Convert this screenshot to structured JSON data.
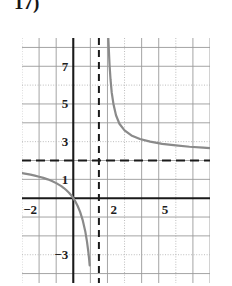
{
  "problem": {
    "number": "17)"
  },
  "chart_data": {
    "type": "line",
    "title": "",
    "xlabel": "",
    "ylabel": "",
    "xlim": [
      -3,
      8
    ],
    "ylim": [
      -4.5,
      8.5
    ],
    "grid": true,
    "grid_step": 1,
    "legend": false,
    "x_tick_labels": [
      {
        "value": -2,
        "text": "−2"
      },
      {
        "value": 2,
        "text": "2"
      },
      {
        "value": 5,
        "text": "5"
      }
    ],
    "y_tick_labels": [
      {
        "value": 7,
        "text": "7"
      },
      {
        "value": 5,
        "text": "5"
      },
      {
        "value": 3,
        "text": "3"
      },
      {
        "value": 1,
        "text": "1"
      },
      {
        "value": -3,
        "text": "−3"
      }
    ],
    "asymptotes": [
      {
        "name": "vertical-asymptote",
        "orientation": "vertical",
        "value": 1.5,
        "style": "dashed",
        "color": "#1a1a1a"
      },
      {
        "name": "horizontal-asymptote",
        "orientation": "horizontal",
        "value": 2.0,
        "style": "dashed",
        "color": "#1a1a1a"
      }
    ],
    "series": [
      {
        "name": "left-branch",
        "color": "#8a8a8a",
        "points": [
          [
            -3.0,
            1.33
          ],
          [
            -2.75,
            1.29
          ],
          [
            -2.5,
            1.25
          ],
          [
            -2.25,
            1.2
          ],
          [
            -2.0,
            1.14
          ],
          [
            -1.75,
            1.08
          ],
          [
            -1.5,
            1.0
          ],
          [
            -1.25,
            0.91
          ],
          [
            -1.0,
            0.8
          ],
          [
            -0.85,
            0.72
          ],
          [
            -0.7,
            0.64
          ],
          [
            -0.55,
            0.54
          ],
          [
            -0.4,
            0.42
          ],
          [
            -0.25,
            0.29
          ],
          [
            -0.1,
            0.13
          ],
          [
            0.0,
            0.0
          ],
          [
            0.1,
            -0.14
          ],
          [
            0.25,
            -0.4
          ],
          [
            0.4,
            -0.73
          ],
          [
            0.55,
            -1.16
          ],
          [
            0.7,
            -1.75
          ],
          [
            0.8,
            -2.29
          ],
          [
            0.88,
            -2.84
          ],
          [
            0.93,
            -3.26
          ],
          [
            0.96,
            -3.56
          ]
        ]
      },
      {
        "name": "right-branch",
        "color": "#8a8a8a",
        "points": [
          [
            2.05,
            8.5
          ],
          [
            2.08,
            7.9
          ],
          [
            2.12,
            7.1
          ],
          [
            2.18,
            6.3
          ],
          [
            2.25,
            5.6
          ],
          [
            2.35,
            5.0
          ],
          [
            2.5,
            4.4
          ],
          [
            2.7,
            3.95
          ],
          [
            3.0,
            3.6
          ],
          [
            3.4,
            3.33
          ],
          [
            3.9,
            3.14
          ],
          [
            4.5,
            3.0
          ],
          [
            5.2,
            2.88
          ],
          [
            6.0,
            2.8
          ],
          [
            6.8,
            2.73
          ],
          [
            7.6,
            2.68
          ],
          [
            8.0,
            2.66
          ]
        ]
      }
    ]
  },
  "colors": {
    "curve": "#8a8a8a",
    "axis": "#1a1a1a",
    "asymptote": "#1a1a1a",
    "grid_major": "#9a9a9a",
    "grid_minor": "#c9c9c9",
    "grid_dotted": "#b5b5b5",
    "text": "#1d1d1d",
    "background": "#ffffff"
  }
}
